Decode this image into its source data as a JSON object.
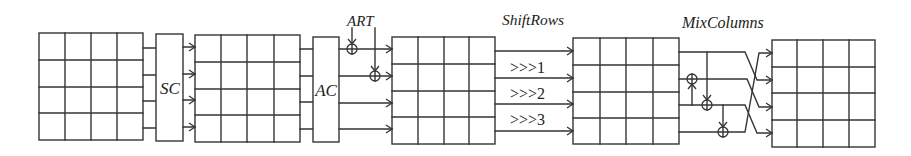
{
  "diagram": {
    "labels": {
      "sc": "SC",
      "ac": "AC",
      "art": "ART",
      "shift_rows": "ShiftRows",
      "mix_columns": "MixColumns"
    },
    "shift_labels": [
      ">>>1",
      ">>>2",
      ">>>3"
    ],
    "state_matrix": {
      "rows": 4,
      "cols": 4,
      "count": 5
    },
    "flow": [
      "state",
      "SC",
      "state",
      "AC",
      "ART",
      "state",
      "ShiftRows",
      "state",
      "MixColumns",
      "state"
    ],
    "colors": {
      "line": "#353535",
      "background": "#ffffff"
    }
  }
}
